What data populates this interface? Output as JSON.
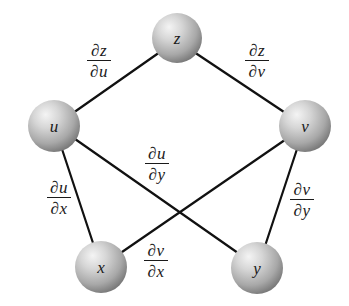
{
  "diagram": {
    "colors": {
      "edge": "#111111",
      "sphere_highlight": "#f2f2f2",
      "sphere_mid": "#c4c4c4",
      "sphere_edge": "#7e7e7e",
      "label": "#1a1a1a"
    },
    "nodes": [
      {
        "id": "z",
        "label": "z",
        "cx": 177,
        "cy": 38,
        "r": 25
      },
      {
        "id": "u",
        "label": "u",
        "cx": 54,
        "cy": 126,
        "r": 26
      },
      {
        "id": "v",
        "label": "v",
        "cx": 305,
        "cy": 126,
        "r": 26
      },
      {
        "id": "x",
        "label": "x",
        "cx": 101,
        "cy": 267,
        "r": 26
      },
      {
        "id": "y",
        "label": "y",
        "cx": 257,
        "cy": 268,
        "r": 26
      }
    ],
    "edges": [
      {
        "from": "z",
        "to": "u",
        "label_num": "∂z",
        "label_den": "∂u"
      },
      {
        "from": "z",
        "to": "v",
        "label_num": "∂z",
        "label_den": "∂v"
      },
      {
        "from": "u",
        "to": "x",
        "label_num": "∂u",
        "label_den": "∂x"
      },
      {
        "from": "u",
        "to": "y",
        "label_num": "∂u",
        "label_den": "∂y"
      },
      {
        "from": "v",
        "to": "x",
        "label_num": "∂v",
        "label_den": "∂x"
      },
      {
        "from": "v",
        "to": "y",
        "label_num": "∂v",
        "label_den": "∂y"
      }
    ]
  }
}
